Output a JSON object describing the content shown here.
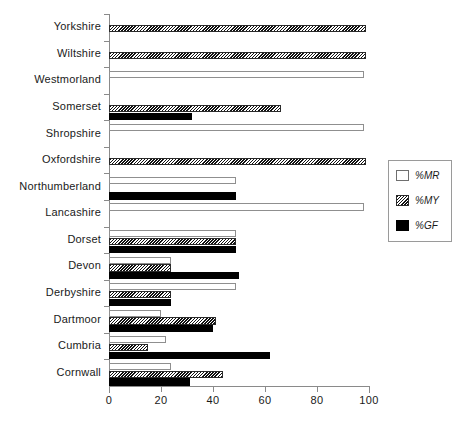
{
  "chart_data": {
    "type": "bar",
    "orientation": "horizontal",
    "title": "",
    "xlabel": "",
    "ylabel": "",
    "xlim": [
      0,
      100
    ],
    "xticks": [
      0,
      20,
      40,
      60,
      80,
      100
    ],
    "grid": false,
    "legend_position": "right",
    "categories": [
      "Yorkshire",
      "Wiltshire",
      "Westmorland",
      "Somerset",
      "Shropshire",
      "Oxfordshire",
      "Northumberland",
      "Lancashire",
      "Dorset",
      "Devon",
      "Derbyshire",
      "Dartmoor",
      "Cumbria",
      "Cornwall"
    ],
    "series": [
      {
        "name": "%MR",
        "fill": "white",
        "values": [
          0,
          0,
          98,
          0,
          98,
          0,
          49,
          98,
          49,
          24,
          49,
          20,
          22,
          24
        ]
      },
      {
        "name": "%MY",
        "fill": "hatched",
        "values": [
          99,
          99,
          0,
          66,
          0,
          99,
          0,
          0,
          49,
          24,
          24,
          41,
          15,
          44
        ]
      },
      {
        "name": "%GF",
        "fill": "black",
        "values": [
          0,
          0,
          0,
          32,
          0,
          0,
          49,
          0,
          49,
          50,
          24,
          40,
          62,
          31
        ]
      }
    ]
  },
  "legend": {
    "entries": [
      {
        "label": "%MR",
        "swatch": "white-square"
      },
      {
        "label": "%MY",
        "swatch": "hatched-square"
      },
      {
        "label": "%GF",
        "swatch": "black-square"
      }
    ]
  },
  "axis": {
    "x_tick_labels": [
      "0",
      "20",
      "40",
      "60",
      "80",
      "100"
    ]
  },
  "colors": {
    "bar_black": "#000000",
    "bar_white": "#ffffff",
    "hatch": "#111111",
    "axis": "#8a8a8a",
    "text": "#1a1a1a"
  }
}
